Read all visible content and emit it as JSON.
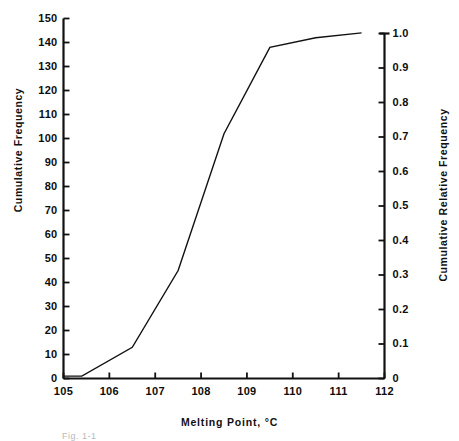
{
  "chart_data": {
    "type": "line",
    "title": "",
    "xlabel": "Melting  Point, °C",
    "ylabel": "Cumulative  Frequency",
    "y2label": "Cumulative  Relative  Frequency",
    "xlim": [
      105,
      112
    ],
    "ylim": [
      0,
      150
    ],
    "y2lim": [
      0,
      1.0
    ],
    "grid": false,
    "legend": null,
    "xticks": [
      105,
      106,
      107,
      108,
      109,
      110,
      111,
      112
    ],
    "xticklabels": [
      "105",
      "106",
      "107",
      "108",
      "109",
      "110",
      "111",
      "112"
    ],
    "yticks": [
      0,
      10,
      20,
      30,
      40,
      50,
      60,
      70,
      80,
      90,
      100,
      110,
      120,
      130,
      140,
      150
    ],
    "yticklabels": [
      "0",
      "10",
      "20",
      "30",
      "40",
      "50",
      "60",
      "70",
      "80",
      "90",
      "100",
      "110",
      "120",
      "130",
      "140",
      "150"
    ],
    "y2ticks": [
      0,
      0.1,
      0.2,
      0.3,
      0.4,
      0.5,
      0.6,
      0.7,
      0.8,
      0.9,
      1.0
    ],
    "y2ticklabels": [
      "0",
      "0.1",
      "0.2",
      "0.3",
      "0.4",
      "0.5",
      "0.6",
      "0.7",
      "0.8",
      "0.9",
      "1.0"
    ],
    "series": [
      {
        "name": "Cumulative frequency ogive",
        "color": "#111111",
        "linewidth": 1.4,
        "x": [
          105.0,
          105.4,
          106.5,
          107.5,
          108.5,
          109.5,
          110.5,
          111.5
        ],
        "y": [
          1,
          1,
          13,
          45,
          102,
          138,
          142,
          144
        ]
      }
    ],
    "axis_color": "#111111",
    "background": "#ffffff"
  },
  "caption": {
    "text": "Fig. 1-1"
  }
}
